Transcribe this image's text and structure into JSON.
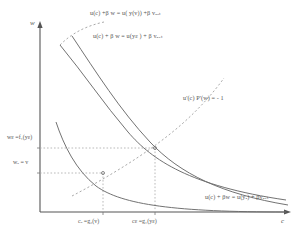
{
  "figure": {
    "axes": {
      "y_label": "w",
      "x_label": "c"
    },
    "y_ticks": [
      {
        "id": "w-eps",
        "label": "wε =f₁(yε)",
        "value": 148
      },
      {
        "id": "w-a",
        "label": "wₐ = v",
        "value": 173
      }
    ],
    "x_ticks": [
      {
        "id": "c-a",
        "label": "cₐ =g₂(v)",
        "value": 103
      },
      {
        "id": "c-eps",
        "label": "cε =g₁(yε)",
        "value": 155
      }
    ],
    "curve_labels": [
      {
        "id": "curve-top",
        "text": "u(c) +β w = u( y(v)) +β vₐᵤₜ"
      },
      {
        "id": "curve-middle",
        "text": "u(c) + β w = u(yε ) + β vₐᵤₜ"
      },
      {
        "id": "curve-bottom",
        "text": "u(c) + βw = u(yₐ) + βvₐᵤₜ"
      }
    ],
    "locus_label": "u'(c) P'(w) = - 1",
    "colors": {
      "axis": "#555555",
      "curve": "#6a6a6a",
      "dashed": "#9a9a9a",
      "guide": "#a8a8a8",
      "text": "#555555"
    }
  }
}
